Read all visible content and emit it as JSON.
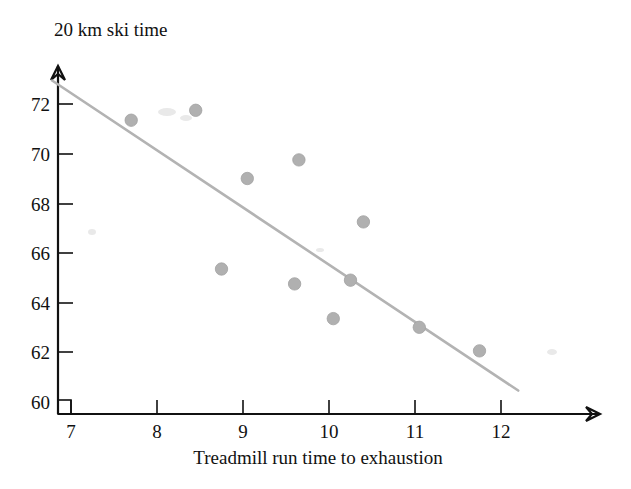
{
  "chart_data": {
    "type": "scatter",
    "title": "",
    "ylabel": "20 km ski time",
    "xlabel": "Treadmill run time to exhaustion",
    "xlim": [
      6.78,
      12.6
    ],
    "ylim": [
      60,
      73.1
    ],
    "xticks": [
      "7",
      "8",
      "9",
      "10",
      "11",
      "12"
    ],
    "yticks": [
      "60",
      "62",
      "64",
      "66",
      "68",
      "70",
      "72"
    ],
    "xtick_values": [
      7,
      8,
      9,
      10,
      11,
      12
    ],
    "ytick_values": [
      60,
      62,
      64,
      66,
      68,
      70,
      72
    ],
    "grid": false,
    "legend": null,
    "axis_break": true,
    "marker_color": "#b0b0b0",
    "line_color": "#b3b3b3",
    "axis_color": "#111111",
    "points": [
      {
        "x": 7.7,
        "y": 71.35
      },
      {
        "x": 8.45,
        "y": 71.75
      },
      {
        "x": 8.75,
        "y": 65.35
      },
      {
        "x": 9.05,
        "y": 69.0
      },
      {
        "x": 9.6,
        "y": 64.75
      },
      {
        "x": 9.65,
        "y": 69.75
      },
      {
        "x": 10.05,
        "y": 63.35
      },
      {
        "x": 10.25,
        "y": 64.9
      },
      {
        "x": 10.4,
        "y": 67.25
      },
      {
        "x": 11.05,
        "y": 63.0
      },
      {
        "x": 11.75,
        "y": 62.05
      }
    ],
    "fit_line": {
      "name": "least-squares regression line",
      "x_start": 6.78,
      "y_start": 72.95,
      "x_end": 12.2,
      "y_end": 60.45
    }
  },
  "labels": {
    "y_axis_title": "20 km ski time",
    "x_axis_title": "Treadmill run time to exhaustion",
    "ytick_0": "60",
    "ytick_1": "62",
    "ytick_2": "64",
    "ytick_3": "66",
    "ytick_4": "68",
    "ytick_5": "70",
    "ytick_6": "72",
    "xtick_0": "7",
    "xtick_1": "8",
    "xtick_2": "9",
    "xtick_3": "10",
    "xtick_4": "11",
    "xtick_5": "12"
  }
}
